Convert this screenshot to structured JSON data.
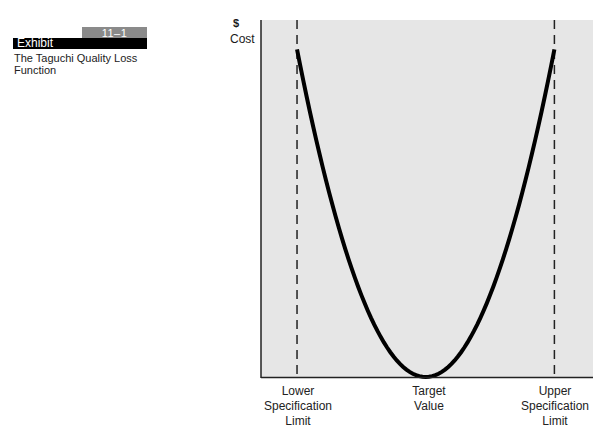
{
  "exhibit": {
    "number": "11–1",
    "label": "Exhibit",
    "title": "The Taguchi Quality Loss Function"
  },
  "colors": {
    "plot_background": "#e6e6e6",
    "curve": "#000000",
    "badge_number_bg": "#8a8a8a",
    "badge_label_bg": "#000000"
  },
  "chart_data": {
    "type": "line",
    "title": "The Taguchi Quality Loss Function",
    "xlabel": "",
    "ylabel": "$ Cost",
    "y_symbol": "$",
    "y_text": "Cost",
    "x_tick_labels": [
      "Lower Specification Limit",
      "Target Value",
      "Upper Specification Limit"
    ],
    "x_ticks_lines": [
      [
        "Lower",
        "Specification",
        "Limit"
      ],
      [
        "Target",
        "Value"
      ],
      [
        "Upper",
        "Specification",
        "Limit"
      ]
    ],
    "series": [
      {
        "name": "Quality loss (quadratic)",
        "description": "U-shaped parabola: loss is zero at target value and rises quadratically toward each specification limit",
        "x": [
          -1.0,
          -0.75,
          -0.5,
          -0.25,
          0.0,
          0.25,
          0.5,
          0.75,
          1.0
        ],
        "values": [
          1.0,
          0.5625,
          0.25,
          0.0625,
          0.0,
          0.0625,
          0.25,
          0.5625,
          1.0
        ]
      }
    ],
    "reference_lines": [
      {
        "name": "Lower Specification Limit",
        "x": -1.0,
        "style": "dashed"
      },
      {
        "name": "Upper Specification Limit",
        "x": 1.0,
        "style": "dashed"
      }
    ],
    "xlim": [
      -1.28,
      1.3
    ],
    "ylim": [
      0,
      1.09
    ],
    "grid": false,
    "legend": "none"
  }
}
